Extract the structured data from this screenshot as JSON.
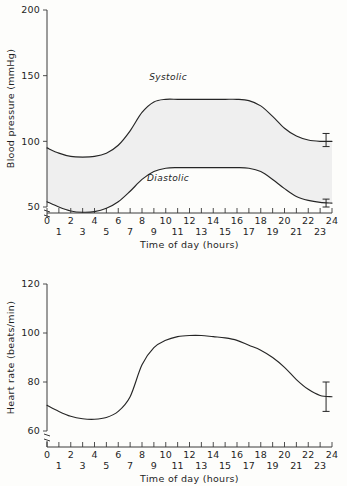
{
  "figure": {
    "background_color": "#fdfdfb",
    "line_color": "#262626",
    "band_fill_color": "#efefef"
  },
  "chart_data": [
    {
      "type": "line",
      "id": "blood-pressure",
      "title": "",
      "xlabel": "Time of day  (hours)",
      "ylabel": "Blood pressure (mmHg)",
      "xlim": [
        0,
        24
      ],
      "ylim": [
        50,
        200
      ],
      "y_axis_break": true,
      "grid": false,
      "legend": "inline-annotation",
      "xticks": [
        0,
        1,
        2,
        3,
        4,
        5,
        6,
        7,
        8,
        9,
        10,
        11,
        12,
        13,
        14,
        15,
        16,
        17,
        18,
        19,
        20,
        21,
        22,
        23,
        24
      ],
      "xticklabels_upper": [
        "0",
        "2",
        "4",
        "6",
        "8",
        "10",
        "12",
        "14",
        "16",
        "18",
        "20",
        "22",
        "24"
      ],
      "xticklabels_lower": [
        "1",
        "3",
        "5",
        "7",
        "9",
        "11",
        "13",
        "15",
        "17",
        "19",
        "21",
        "23"
      ],
      "yticks": [
        50,
        100,
        150,
        200
      ],
      "yticklabels": [
        "50",
        "100",
        "150",
        "200"
      ],
      "annotations": [
        {
          "text": "Systolic",
          "x": 10.2,
          "y": 147
        },
        {
          "text": "Diastolic",
          "x": 10.2,
          "y": 70
        }
      ],
      "series": [
        {
          "name": "Systolic",
          "x": [
            0,
            1,
            2,
            3,
            4,
            5,
            6,
            7,
            8,
            9,
            10,
            11,
            12,
            13,
            14,
            15,
            16,
            17,
            18,
            19,
            20,
            21,
            22,
            23,
            24
          ],
          "values": [
            95,
            91,
            88.5,
            88,
            88.5,
            91,
            97,
            108,
            122,
            130,
            132,
            132,
            132,
            132,
            132,
            132,
            132,
            131,
            127,
            119,
            110,
            104,
            101,
            100,
            100
          ],
          "error_bar": {
            "x": 23.5,
            "value": 100,
            "lower": 96,
            "upper": 106
          }
        },
        {
          "name": "Diastolic",
          "x": [
            0,
            1,
            2,
            3,
            4,
            5,
            6,
            7,
            8,
            9,
            10,
            11,
            12,
            13,
            14,
            15,
            16,
            17,
            18,
            19,
            20,
            21,
            22,
            23,
            24
          ],
          "values": [
            54,
            50,
            47,
            46,
            46.5,
            49,
            54,
            62,
            71,
            77,
            79.5,
            80,
            80,
            80,
            80,
            80,
            80,
            79.5,
            77,
            71,
            64,
            58,
            55,
            53.5,
            53
          ],
          "error_bar": {
            "x": 23.5,
            "value": 53,
            "lower": 50,
            "upper": 56
          }
        }
      ]
    },
    {
      "type": "line",
      "id": "heart-rate",
      "title": "",
      "xlabel": "Time of day  (hours)",
      "ylabel": "Heart rate (beats/min)",
      "xlim": [
        0,
        24
      ],
      "ylim": [
        60,
        120
      ],
      "y_axis_break": true,
      "grid": false,
      "legend": "none",
      "xticks": [
        0,
        1,
        2,
        3,
        4,
        5,
        6,
        7,
        8,
        9,
        10,
        11,
        12,
        13,
        14,
        15,
        16,
        17,
        18,
        19,
        20,
        21,
        22,
        23,
        24
      ],
      "xticklabels_upper": [
        "0",
        "2",
        "4",
        "6",
        "8",
        "10",
        "12",
        "14",
        "16",
        "18",
        "20",
        "22",
        "24"
      ],
      "xticklabels_lower": [
        "1",
        "3",
        "5",
        "7",
        "9",
        "11",
        "13",
        "15",
        "17",
        "19",
        "21",
        "23"
      ],
      "yticks": [
        60,
        80,
        100,
        120
      ],
      "yticklabels": [
        "60",
        "80",
        "100",
        "120"
      ],
      "annotations": [],
      "series": [
        {
          "name": "Heart rate",
          "x": [
            0,
            1,
            2,
            3,
            4,
            5,
            6,
            7,
            8,
            9,
            10,
            11,
            12,
            13,
            14,
            15,
            16,
            17,
            18,
            19,
            20,
            21,
            22,
            23,
            24
          ],
          "values": [
            70.5,
            68,
            66,
            65,
            64.8,
            65.5,
            68,
            74,
            87,
            94,
            97,
            98.5,
            99,
            99,
            98.5,
            98,
            97,
            95,
            93,
            90,
            86,
            81,
            77,
            74.5,
            74
          ],
          "error_bar": {
            "x": 23.5,
            "value": 74,
            "lower": 68,
            "upper": 80
          }
        }
      ]
    }
  ]
}
